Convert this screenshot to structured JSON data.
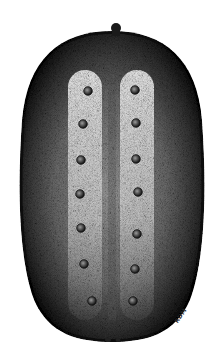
{
  "figure": {
    "signature": "RDM",
    "colors": {
      "background": "#ffffff",
      "ink": "#111111",
      "highlight": "#e8e8e8"
    },
    "body": {
      "cx": 112,
      "cy": 188,
      "rx": 94,
      "ry": 158
    },
    "stem": {
      "cx": 116,
      "cy": 28
    },
    "tubercles": {
      "left": [
        [
          88,
          91
        ],
        [
          83,
          124
        ],
        [
          81,
          160
        ],
        [
          80,
          194
        ],
        [
          81,
          228
        ],
        [
          84,
          264
        ],
        [
          92,
          301
        ]
      ],
      "right": [
        [
          135,
          90
        ],
        [
          136,
          123
        ],
        [
          136,
          159
        ],
        [
          138,
          192
        ],
        [
          137,
          234
        ],
        [
          135,
          269
        ],
        [
          133,
          301
        ]
      ]
    }
  }
}
